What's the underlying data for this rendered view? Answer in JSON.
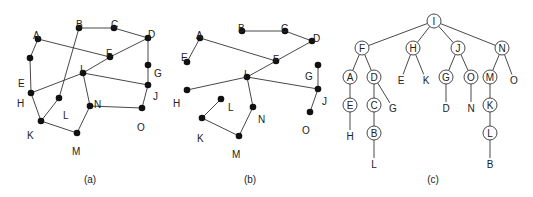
{
  "figure": {
    "panels": [
      {
        "id": "a",
        "caption": "(a)",
        "caption_pos": [
          90,
          183
        ],
        "description": "Undirected graph with 15 vertices",
        "nodes": [
          {
            "id": "A",
            "x": 38,
            "y": 39,
            "lx": 33,
            "ly": 31
          },
          {
            "id": "B",
            "x": 79,
            "y": 28,
            "lx": 76,
            "ly": 20
          },
          {
            "id": "C",
            "x": 114,
            "y": 28,
            "lx": 111,
            "ly": 20
          },
          {
            "id": "D",
            "x": 148,
            "y": 38,
            "lx": 148,
            "ly": 30
          },
          {
            "id": "E",
            "x": 30,
            "y": 58,
            "lx": 18,
            "ly": 79
          },
          {
            "id": "F",
            "x": 110,
            "y": 57,
            "lx": 106,
            "ly": 49
          },
          {
            "id": "G",
            "x": 148,
            "y": 65,
            "lx": 154,
            "ly": 69
          },
          {
            "id": "H",
            "x": 31,
            "y": 93,
            "lx": 17,
            "ly": 99
          },
          {
            "id": "I",
            "x": 83,
            "y": 73,
            "lx": 80,
            "ly": 65
          },
          {
            "id": "J",
            "x": 148,
            "y": 85,
            "lx": 153,
            "ly": 92
          },
          {
            "id": "K",
            "x": 41,
            "y": 121,
            "lx": 27,
            "ly": 131
          },
          {
            "id": "L",
            "x": 59,
            "y": 98,
            "lx": 63,
            "ly": 111
          },
          {
            "id": "M",
            "x": 77,
            "y": 133,
            "lx": 72,
            "ly": 147
          },
          {
            "id": "N",
            "x": 90,
            "y": 106,
            "lx": 94,
            "ly": 100
          },
          {
            "id": "O",
            "x": 142,
            "y": 108,
            "lx": 137,
            "ly": 123
          }
        ],
        "edges": [
          [
            "A",
            "E"
          ],
          [
            "E",
            "H"
          ],
          [
            "H",
            "K"
          ],
          [
            "K",
            "M"
          ],
          [
            "M",
            "N"
          ],
          [
            "N",
            "I"
          ],
          [
            "N",
            "O"
          ],
          [
            "O",
            "J"
          ],
          [
            "J",
            "G"
          ],
          [
            "G",
            "D"
          ],
          [
            "D",
            "C"
          ],
          [
            "C",
            "B"
          ],
          [
            "B",
            "L"
          ],
          [
            "L",
            "K"
          ],
          [
            "A",
            "F"
          ],
          [
            "F",
            "D"
          ],
          [
            "F",
            "I"
          ],
          [
            "I",
            "H"
          ],
          [
            "I",
            "J"
          ]
        ]
      },
      {
        "id": "b",
        "caption": "(b)",
        "caption_pos": [
          250,
          183
        ],
        "description": "Spanning tree of graph (a)",
        "nodes": [
          {
            "id": "A",
            "x": 200,
            "y": 38,
            "lx": 196,
            "ly": 31
          },
          {
            "id": "B",
            "x": 242,
            "y": 31,
            "lx": 238,
            "ly": 24
          },
          {
            "id": "C",
            "x": 285,
            "y": 31,
            "lx": 281,
            "ly": 24
          },
          {
            "id": "D",
            "x": 312,
            "y": 41,
            "lx": 313,
            "ly": 34
          },
          {
            "id": "E",
            "x": 187,
            "y": 62,
            "lx": 181,
            "ly": 53
          },
          {
            "id": "F",
            "x": 276,
            "y": 61,
            "lx": 273,
            "ly": 55
          },
          {
            "id": "G",
            "x": 318,
            "y": 65,
            "lx": 305,
            "ly": 72
          },
          {
            "id": "H",
            "x": 187,
            "y": 90,
            "lx": 173,
            "ly": 99
          },
          {
            "id": "I",
            "x": 247,
            "y": 77,
            "lx": 244,
            "ly": 70
          },
          {
            "id": "J",
            "x": 318,
            "y": 89,
            "lx": 322,
            "ly": 97
          },
          {
            "id": "K",
            "x": 202,
            "y": 118,
            "lx": 197,
            "ly": 134
          },
          {
            "id": "L",
            "x": 221,
            "y": 99,
            "lx": 228,
            "ly": 103
          },
          {
            "id": "M",
            "x": 239,
            "y": 136,
            "lx": 232,
            "ly": 150
          },
          {
            "id": "N",
            "x": 253,
            "y": 107,
            "lx": 258,
            "ly": 115
          },
          {
            "id": "O",
            "x": 310,
            "y": 112,
            "lx": 302,
            "ly": 126
          }
        ],
        "edges": [
          [
            "A",
            "E"
          ],
          [
            "A",
            "F"
          ],
          [
            "B",
            "C"
          ],
          [
            "C",
            "D"
          ],
          [
            "D",
            "F"
          ],
          [
            "F",
            "I"
          ],
          [
            "I",
            "H"
          ],
          [
            "I",
            "J"
          ],
          [
            "I",
            "N"
          ],
          [
            "N",
            "M"
          ],
          [
            "M",
            "K"
          ],
          [
            "K",
            "L"
          ],
          [
            "G",
            "J"
          ],
          [
            "J",
            "O"
          ]
        ]
      },
      {
        "id": "c",
        "caption": "(c)",
        "caption_pos": [
          433,
          183
        ],
        "description": "Sink tree rooted at I",
        "node_radius": 7,
        "nodes": [
          {
            "id": "I",
            "label": "I",
            "x": 434,
            "y": 21,
            "circle": true
          },
          {
            "id": "F",
            "label": "F",
            "x": 362,
            "y": 48,
            "circle": true
          },
          {
            "id": "H",
            "label": "H",
            "x": 413,
            "y": 48,
            "circle": true
          },
          {
            "id": "J",
            "label": "J",
            "x": 458,
            "y": 48,
            "circle": true
          },
          {
            "id": "N",
            "label": "N",
            "x": 502,
            "y": 48,
            "circle": true
          },
          {
            "id": "A",
            "label": "A",
            "x": 350,
            "y": 77,
            "circle": true
          },
          {
            "id": "D",
            "label": "D",
            "x": 374,
            "y": 77,
            "circle": true
          },
          {
            "id": "Eleaf",
            "label": "E",
            "x": 401,
            "y": 80,
            "circle": false
          },
          {
            "id": "Kleaf",
            "label": "K",
            "x": 426,
            "y": 80,
            "circle": false
          },
          {
            "id": "G",
            "label": "G",
            "x": 446,
            "y": 77,
            "circle": true
          },
          {
            "id": "O",
            "label": "O",
            "x": 471,
            "y": 77,
            "circle": true
          },
          {
            "id": "M",
            "label": "M",
            "x": 490,
            "y": 77,
            "circle": true
          },
          {
            "id": "Oleaf",
            "label": "O",
            "x": 514,
            "y": 80,
            "circle": false
          },
          {
            "id": "E",
            "label": "E",
            "x": 350,
            "y": 105,
            "circle": true
          },
          {
            "id": "C",
            "label": "C",
            "x": 374,
            "y": 105,
            "circle": true
          },
          {
            "id": "Gleaf",
            "label": "G",
            "x": 393,
            "y": 108,
            "circle": false
          },
          {
            "id": "Dleaf",
            "label": "D",
            "x": 446,
            "y": 108,
            "circle": false
          },
          {
            "id": "Nleaf",
            "label": "N",
            "x": 471,
            "y": 108,
            "circle": false
          },
          {
            "id": "K",
            "label": "K",
            "x": 490,
            "y": 105,
            "circle": true
          },
          {
            "id": "Hleaf",
            "label": "H",
            "x": 350,
            "y": 136,
            "circle": false
          },
          {
            "id": "B",
            "label": "B",
            "x": 374,
            "y": 133,
            "circle": true
          },
          {
            "id": "L",
            "label": "L",
            "x": 490,
            "y": 133,
            "circle": true
          },
          {
            "id": "Lleaf",
            "label": "L",
            "x": 374,
            "y": 164,
            "circle": false
          },
          {
            "id": "Bleaf",
            "label": "B",
            "x": 490,
            "y": 164,
            "circle": false
          }
        ],
        "edges": [
          [
            "I",
            "F"
          ],
          [
            "I",
            "H"
          ],
          [
            "I",
            "J"
          ],
          [
            "I",
            "N"
          ],
          [
            "F",
            "A"
          ],
          [
            "F",
            "D"
          ],
          [
            "H",
            "Eleaf"
          ],
          [
            "H",
            "Kleaf"
          ],
          [
            "J",
            "G"
          ],
          [
            "J",
            "O"
          ],
          [
            "N",
            "M"
          ],
          [
            "N",
            "Oleaf"
          ],
          [
            "A",
            "E"
          ],
          [
            "D",
            "C"
          ],
          [
            "D",
            "Gleaf"
          ],
          [
            "G",
            "Dleaf"
          ],
          [
            "O",
            "Nleaf"
          ],
          [
            "M",
            "K"
          ],
          [
            "E",
            "Hleaf"
          ],
          [
            "C",
            "B"
          ],
          [
            "K",
            "L"
          ],
          [
            "B",
            "Lleaf"
          ],
          [
            "L",
            "Bleaf"
          ]
        ]
      }
    ]
  }
}
